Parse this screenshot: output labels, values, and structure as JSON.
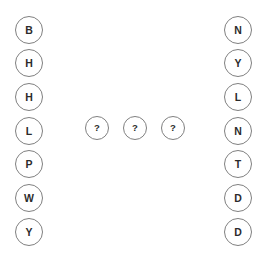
{
  "canvas": {
    "width": 269,
    "height": 253,
    "background_color": "#ffffff",
    "node_stroke_color": "#808080",
    "node_text_color": "#2b2b2b"
  },
  "left_column": {
    "name": "left-column",
    "node_diameter": 28,
    "x": 15,
    "nodes": [
      {
        "label": "B",
        "cx": 29,
        "cy": 30
      },
      {
        "label": "H",
        "cx": 29,
        "cy": 63
      },
      {
        "label": "H",
        "cx": 29,
        "cy": 97
      },
      {
        "label": "L",
        "cx": 29,
        "cy": 131
      },
      {
        "label": "P",
        "cx": 29,
        "cy": 164
      },
      {
        "label": "W",
        "cx": 29,
        "cy": 198
      },
      {
        "label": "Y",
        "cx": 29,
        "cy": 232
      }
    ]
  },
  "center_column": {
    "name": "center-column",
    "node_diameter": 24,
    "nodes": [
      {
        "label": "?",
        "cx": 97,
        "cy": 128
      },
      {
        "label": "?",
        "cx": 135,
        "cy": 128
      },
      {
        "label": "?",
        "cx": 173,
        "cy": 128
      }
    ]
  },
  "right_column": {
    "name": "right-column",
    "node_diameter": 28,
    "x": 224,
    "nodes": [
      {
        "label": "N",
        "cx": 238,
        "cy": 30
      },
      {
        "label": "Y",
        "cx": 238,
        "cy": 63
      },
      {
        "label": "L",
        "cx": 238,
        "cy": 97
      },
      {
        "label": "N",
        "cx": 238,
        "cy": 131
      },
      {
        "label": "T",
        "cx": 238,
        "cy": 164
      },
      {
        "label": "D",
        "cx": 238,
        "cy": 198
      },
      {
        "label": "D",
        "cx": 238,
        "cy": 232
      }
    ]
  }
}
